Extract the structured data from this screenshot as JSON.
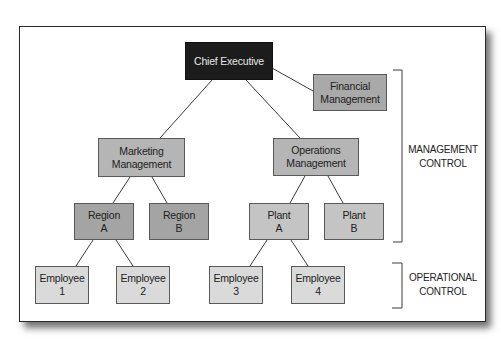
{
  "diagram": {
    "type": "organizational-chart",
    "nodes": {
      "chief_executive": {
        "line1": "Chief Executive",
        "line2": ""
      },
      "financial": {
        "line1": "Financial",
        "line2": "Management"
      },
      "marketing": {
        "line1": "Marketing",
        "line2": "Management"
      },
      "operations": {
        "line1": "Operations",
        "line2": "Management"
      },
      "region_a": {
        "line1": "Region",
        "line2": "A"
      },
      "region_b": {
        "line1": "Region",
        "line2": "B"
      },
      "plant_a": {
        "line1": "Plant",
        "line2": "A"
      },
      "plant_b": {
        "line1": "Plant",
        "line2": "B"
      },
      "employee_1": {
        "line1": "Employee",
        "line2": "1"
      },
      "employee_2": {
        "line1": "Employee",
        "line2": "2"
      },
      "employee_3": {
        "line1": "Employee",
        "line2": "3"
      },
      "employee_4": {
        "line1": "Employee",
        "line2": "4"
      }
    },
    "edges": [
      [
        "chief_executive",
        "financial"
      ],
      [
        "chief_executive",
        "marketing"
      ],
      [
        "chief_executive",
        "operations"
      ],
      [
        "marketing",
        "region_a"
      ],
      [
        "marketing",
        "region_b"
      ],
      [
        "operations",
        "plant_a"
      ],
      [
        "operations",
        "plant_b"
      ],
      [
        "region_a",
        "employee_1"
      ],
      [
        "region_a",
        "employee_2"
      ],
      [
        "plant_a",
        "employee_3"
      ],
      [
        "plant_a",
        "employee_4"
      ]
    ],
    "brackets": {
      "management": {
        "line1": "MANAGEMENT",
        "line2": "CONTROL"
      },
      "operational": {
        "line1": "OPERATIONAL",
        "line2": "CONTROL"
      }
    },
    "colors": {
      "executive": "#1c1c1c",
      "financial": "#a9a9a9",
      "management": "#b5b5b5",
      "region": "#a4a4a4",
      "plant": "#c4c4c4",
      "employee": "#dadada",
      "line": "#3a3a3a"
    }
  }
}
